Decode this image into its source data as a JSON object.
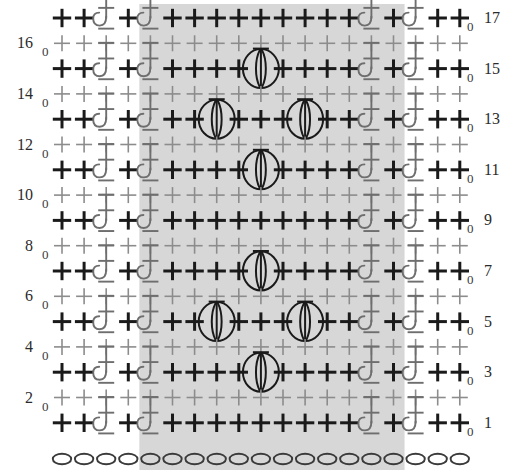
{
  "grid": {
    "columns": 19,
    "rows": 17,
    "foundation_chain_count": 19,
    "colors": {
      "repeat_shade": "#d7d7d7",
      "ws_row_stitch": "#8c8c8c",
      "rs_row_stitch": "#1a1a1a",
      "post_stitch": "#6e6e6e",
      "puff_stitch": "#1a1a1a",
      "chain_oval": "#3a3a3a",
      "label": "#2b2b2b",
      "background": "#ffffff"
    },
    "repeat_region": {
      "start_column": 5,
      "end_column": 16,
      "label": "pattern repeat"
    }
  },
  "legend_symbols": {
    "single_crochet": "plus-symbol",
    "chain": "oval-symbol",
    "front_post_double_crochet": "post-stitch-symbol",
    "puff_stitch": "puff-symbol",
    "turning_chain": "0"
  },
  "left_row_numbers": [
    "16",
    "14",
    "12",
    "10",
    "8",
    "6",
    "4",
    "2"
  ],
  "right_row_numbers": [
    "17",
    "15",
    "13",
    "11",
    "9",
    "7",
    "5",
    "3",
    "1"
  ],
  "turning_chain_label": "0",
  "rows": [
    {
      "number": "17",
      "side": "right",
      "stitches": [
        "sc",
        "sc",
        "fpdc",
        "sc",
        "fpdc",
        "sc",
        "sc",
        "sc",
        "sc",
        "sc",
        "sc",
        "sc",
        "sc",
        "sc",
        "fpdc",
        "sc",
        "fpdc",
        "sc",
        "sc"
      ]
    },
    {
      "number": "16",
      "side": "wrong",
      "stitches": [
        "sc",
        "sc",
        "sc",
        "sc",
        "sc",
        "sc",
        "sc",
        "sc",
        "sc",
        "sc",
        "sc",
        "sc",
        "sc",
        "sc",
        "sc",
        "sc",
        "sc",
        "sc",
        "sc"
      ]
    },
    {
      "number": "15",
      "side": "right",
      "stitches": [
        "sc",
        "sc",
        "fpdc",
        "sc",
        "fpdc",
        "sc",
        "sc",
        "sc",
        "sc",
        "puff",
        "sc",
        "sc",
        "sc",
        "sc",
        "fpdc",
        "sc",
        "fpdc",
        "sc",
        "sc"
      ]
    },
    {
      "number": "14",
      "side": "wrong",
      "stitches": [
        "sc",
        "sc",
        "sc",
        "sc",
        "sc",
        "sc",
        "sc",
        "sc",
        "sc",
        "sc",
        "sc",
        "sc",
        "sc",
        "sc",
        "sc",
        "sc",
        "sc",
        "sc",
        "sc"
      ]
    },
    {
      "number": "13",
      "side": "right",
      "stitches": [
        "sc",
        "sc",
        "fpdc",
        "sc",
        "fpdc",
        "sc",
        "sc",
        "puff",
        "sc",
        "sc",
        "sc",
        "puff",
        "sc",
        "sc",
        "fpdc",
        "sc",
        "fpdc",
        "sc",
        "sc"
      ]
    },
    {
      "number": "12",
      "side": "wrong",
      "stitches": [
        "sc",
        "sc",
        "sc",
        "sc",
        "sc",
        "sc",
        "sc",
        "sc",
        "sc",
        "sc",
        "sc",
        "sc",
        "sc",
        "sc",
        "sc",
        "sc",
        "sc",
        "sc",
        "sc"
      ]
    },
    {
      "number": "11",
      "side": "right",
      "stitches": [
        "sc",
        "sc",
        "fpdc",
        "sc",
        "fpdc",
        "sc",
        "sc",
        "sc",
        "sc",
        "puff",
        "sc",
        "sc",
        "sc",
        "sc",
        "fpdc",
        "sc",
        "fpdc",
        "sc",
        "sc"
      ]
    },
    {
      "number": "10",
      "side": "wrong",
      "stitches": [
        "sc",
        "sc",
        "sc",
        "sc",
        "sc",
        "sc",
        "sc",
        "sc",
        "sc",
        "sc",
        "sc",
        "sc",
        "sc",
        "sc",
        "sc",
        "sc",
        "sc",
        "sc",
        "sc"
      ]
    },
    {
      "number": "9",
      "side": "right",
      "stitches": [
        "sc",
        "sc",
        "fpdc",
        "sc",
        "fpdc",
        "sc",
        "sc",
        "sc",
        "sc",
        "sc",
        "sc",
        "sc",
        "sc",
        "sc",
        "fpdc",
        "sc",
        "fpdc",
        "sc",
        "sc"
      ]
    },
    {
      "number": "8",
      "side": "wrong",
      "stitches": [
        "sc",
        "sc",
        "sc",
        "sc",
        "sc",
        "sc",
        "sc",
        "sc",
        "sc",
        "sc",
        "sc",
        "sc",
        "sc",
        "sc",
        "sc",
        "sc",
        "sc",
        "sc",
        "sc"
      ]
    },
    {
      "number": "7",
      "side": "right",
      "stitches": [
        "sc",
        "sc",
        "fpdc",
        "sc",
        "fpdc",
        "sc",
        "sc",
        "sc",
        "sc",
        "puff",
        "sc",
        "sc",
        "sc",
        "sc",
        "fpdc",
        "sc",
        "fpdc",
        "sc",
        "sc"
      ]
    },
    {
      "number": "6",
      "side": "wrong",
      "stitches": [
        "sc",
        "sc",
        "sc",
        "sc",
        "sc",
        "sc",
        "sc",
        "sc",
        "sc",
        "sc",
        "sc",
        "sc",
        "sc",
        "sc",
        "sc",
        "sc",
        "sc",
        "sc",
        "sc"
      ]
    },
    {
      "number": "5",
      "side": "right",
      "stitches": [
        "sc",
        "sc",
        "fpdc",
        "sc",
        "fpdc",
        "sc",
        "sc",
        "puff",
        "sc",
        "sc",
        "sc",
        "puff",
        "sc",
        "sc",
        "fpdc",
        "sc",
        "fpdc",
        "sc",
        "sc"
      ]
    },
    {
      "number": "4",
      "side": "wrong",
      "stitches": [
        "sc",
        "sc",
        "sc",
        "sc",
        "sc",
        "sc",
        "sc",
        "sc",
        "sc",
        "sc",
        "sc",
        "sc",
        "sc",
        "sc",
        "sc",
        "sc",
        "sc",
        "sc",
        "sc"
      ]
    },
    {
      "number": "3",
      "side": "right",
      "stitches": [
        "sc",
        "sc",
        "fpdc",
        "sc",
        "fpdc",
        "sc",
        "sc",
        "sc",
        "sc",
        "puff",
        "sc",
        "sc",
        "sc",
        "sc",
        "fpdc",
        "sc",
        "fpdc",
        "sc",
        "sc"
      ]
    },
    {
      "number": "2",
      "side": "wrong",
      "stitches": [
        "sc",
        "sc",
        "sc",
        "sc",
        "sc",
        "sc",
        "sc",
        "sc",
        "sc",
        "sc",
        "sc",
        "sc",
        "sc",
        "sc",
        "sc",
        "sc",
        "sc",
        "sc",
        "sc"
      ]
    },
    {
      "number": "1",
      "side": "right",
      "stitches": [
        "sc",
        "sc",
        "fpdc",
        "sc",
        "fpdc",
        "sc",
        "sc",
        "sc",
        "sc",
        "sc",
        "sc",
        "sc",
        "sc",
        "sc",
        "fpdc",
        "sc",
        "fpdc",
        "sc",
        "sc"
      ]
    }
  ],
  "foundation_row": {
    "symbol": "chain",
    "count": 19
  }
}
